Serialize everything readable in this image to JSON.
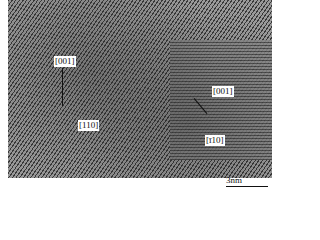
{
  "image": {
    "type": "HRTEM micrograph",
    "labels": [
      "[001]",
      "[110]",
      "[001]",
      "[ī10]"
    ],
    "scale_bar": "3nm"
  }
}
